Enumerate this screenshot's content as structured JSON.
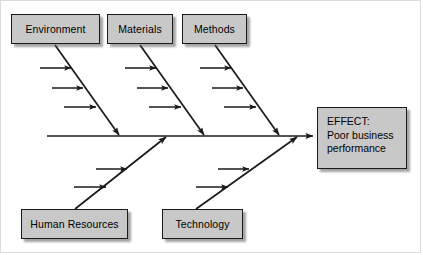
{
  "diagram": {
    "type": "fishbone-ishikawa",
    "effect": {
      "line1": "EFFECT:",
      "line2": "Poor business",
      "line3": "performance"
    },
    "causes_top": [
      {
        "label": "Environment",
        "sub_cause_arrows": 3
      },
      {
        "label": "Materials",
        "sub_cause_arrows": 3
      },
      {
        "label": "Methods",
        "sub_cause_arrows": 3
      }
    ],
    "causes_bottom": [
      {
        "label": "Human Resources",
        "sub_cause_arrows": 2
      },
      {
        "label": "Technology",
        "sub_cause_arrows": 2
      }
    ],
    "colors": {
      "box_fill": "#c8c8c8",
      "box_border": "#1a1a1a",
      "line": "#1a1a1a",
      "background": "#ffffff",
      "frame": "#dcdcdc",
      "text": "#000000"
    }
  }
}
